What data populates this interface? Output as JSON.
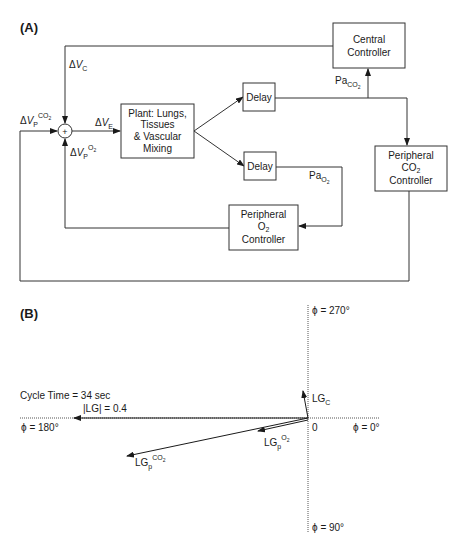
{
  "panel_a": {
    "label": "(A)",
    "blocks": {
      "central_controller": [
        "Central",
        "Controller"
      ],
      "plant": [
        "Plant: Lungs,",
        "Tissues",
        "& Vascular",
        "Mixing"
      ],
      "delay_top": "Delay",
      "delay_bottom": "Delay",
      "peripheral_co2": [
        "Peripheral",
        "CO",
        "2",
        "Controller"
      ],
      "peripheral_o2": [
        "Peripheral",
        "O",
        "2",
        "Controller"
      ]
    },
    "summing_junction": "+",
    "signals": {
      "dvc": {
        "delta": "Δ",
        "v": "V",
        "sub": "C"
      },
      "dve": {
        "delta": "Δ",
        "v": "V",
        "sub": "E"
      },
      "dvp_co2": {
        "delta": "Δ",
        "v": "V",
        "sub": "P",
        "sup": "CO",
        "sup_sub": "2"
      },
      "dvp_o2": {
        "delta": "Δ",
        "v": "V",
        "sub": "P",
        "sup": "O",
        "sup_sub": "2"
      },
      "pa_co2": {
        "base": "Pa",
        "sub": "CO",
        "sub_sub": "2"
      },
      "pa_o2": {
        "base": "Pa",
        "sub": "O",
        "sub_sub": "2"
      }
    }
  },
  "panel_b": {
    "label": "(B)",
    "axes": {
      "phi_270": "ϕ = 270°",
      "phi_180": "ϕ = 180°",
      "phi_0": "ϕ = 0°",
      "phi_90": "ϕ = 90°",
      "origin": "0"
    },
    "cycle_time": "Cycle Time = 34 sec",
    "lg_magnitude": "|LG| = 0.4",
    "vectors": {
      "lg_c": {
        "base": "LG",
        "sub": "C"
      },
      "lg_p_o2": {
        "base": "LG",
        "sub": "p",
        "sup": "O",
        "sup_sub": "2"
      },
      "lg_p_co2": {
        "base": "LG",
        "sub": "p",
        "sup": "CO",
        "sup_sub": "2"
      }
    }
  }
}
